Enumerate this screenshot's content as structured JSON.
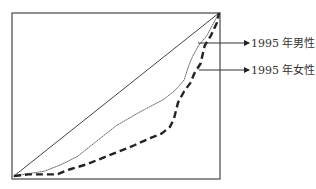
{
  "chart_data": {
    "type": "line",
    "title": "",
    "xlabel": "",
    "ylabel": "",
    "xlim": [
      0,
      1
    ],
    "ylim": [
      0,
      1
    ],
    "grid": false,
    "legend": "right (arrow callouts)",
    "series": [
      {
        "name": "equality-line",
        "label": "",
        "style": "solid",
        "x": [
          0,
          1
        ],
        "y": [
          0,
          1
        ]
      },
      {
        "name": "male-1995",
        "label": "1995 年男性",
        "style": "dotted",
        "x": [
          0,
          0.15,
          0.23,
          0.31,
          0.41,
          0.5,
          0.61,
          0.73,
          0.79,
          0.83,
          0.85,
          0.87,
          0.9,
          0.94,
          1.0
        ],
        "y": [
          0,
          0.03,
          0.07,
          0.12,
          0.22,
          0.31,
          0.39,
          0.47,
          0.53,
          0.59,
          0.67,
          0.73,
          0.8,
          0.86,
          1.0
        ]
      },
      {
        "name": "female-1995",
        "label": "1995 年女性",
        "style": "dashed",
        "x": [
          0,
          0.07,
          0.15,
          0.21,
          0.27,
          0.35,
          0.43,
          0.51,
          0.59,
          0.66,
          0.72,
          0.76,
          0.78,
          0.8,
          0.83,
          0.86,
          0.88,
          0.91,
          0.93,
          0.96,
          0.99,
          1.0
        ],
        "y": [
          0,
          0.01,
          0.01,
          0.01,
          0.04,
          0.07,
          0.11,
          0.15,
          0.19,
          0.23,
          0.26,
          0.3,
          0.35,
          0.45,
          0.52,
          0.57,
          0.63,
          0.69,
          0.8,
          0.86,
          0.94,
          1.0
        ]
      }
    ],
    "annotations": [
      {
        "text": "1995 年男性",
        "target": "male-1995",
        "arrow": true
      },
      {
        "text": "1995 年女性",
        "target": "female-1995",
        "arrow": true
      }
    ]
  }
}
